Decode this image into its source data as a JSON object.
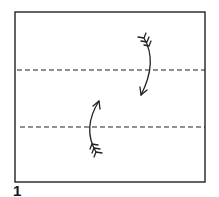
{
  "diagram": {
    "type": "origami-fold-step",
    "step_number": "1",
    "paper": {
      "x": 15,
      "y": 12,
      "width": 190,
      "height": 170,
      "stroke": "#222222"
    },
    "fold_lines": [
      {
        "style": "valley-dashed",
        "y": 70,
        "x1": 17,
        "x2": 205
      },
      {
        "style": "valley-dashed",
        "y": 127,
        "x1": 20,
        "x2": 205
      }
    ],
    "arrows": [
      {
        "direction": "down",
        "description": "fold top edge down to lower crease"
      },
      {
        "direction": "up",
        "description": "fold bottom edge up to upper crease"
      }
    ],
    "ink_color": "#222222"
  }
}
